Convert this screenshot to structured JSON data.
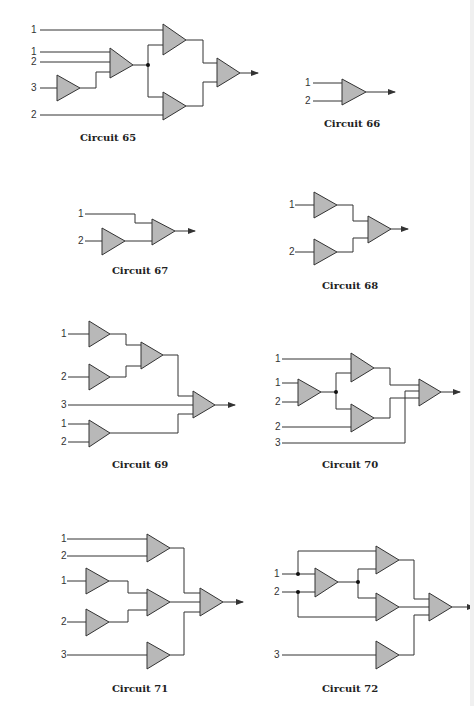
{
  "page": {
    "background": "#ffffff",
    "gate_fill": "#b8b8b8",
    "wire_color": "#333333"
  },
  "circuits": [
    {
      "id": "65",
      "caption": "Circuit 65",
      "caption_pos": [
        108,
        137
      ]
    },
    {
      "id": "66",
      "caption": "Circuit 66",
      "caption_pos": [
        352,
        123
      ]
    },
    {
      "id": "67",
      "caption": "Circuit 67",
      "caption_pos": [
        140,
        270
      ]
    },
    {
      "id": "68",
      "caption": "Circuit 68",
      "caption_pos": [
        350,
        285
      ]
    },
    {
      "id": "69",
      "caption": "Circuit 69",
      "caption_pos": [
        140,
        464
      ]
    },
    {
      "id": "70",
      "caption": "Circuit 70",
      "caption_pos": [
        350,
        464
      ]
    },
    {
      "id": "71",
      "caption": "Circuit 71",
      "caption_pos": [
        140,
        688
      ]
    },
    {
      "id": "72",
      "caption": "Circuit 72",
      "caption_pos": [
        350,
        688
      ]
    }
  ],
  "input_labels": {
    "c65": [
      "1",
      "1",
      "2",
      "3",
      "2"
    ],
    "c66": [
      "1",
      "2"
    ],
    "c67": [
      "1",
      "2"
    ],
    "c68": [
      "1",
      "2"
    ],
    "c69": [
      "1",
      "2",
      "3",
      "1",
      "2"
    ],
    "c70": [
      "1",
      "1",
      "2",
      "2",
      "3"
    ],
    "c71": [
      "1",
      "2",
      "1",
      "2",
      "3"
    ],
    "c72": [
      "1",
      "2",
      "3"
    ]
  }
}
